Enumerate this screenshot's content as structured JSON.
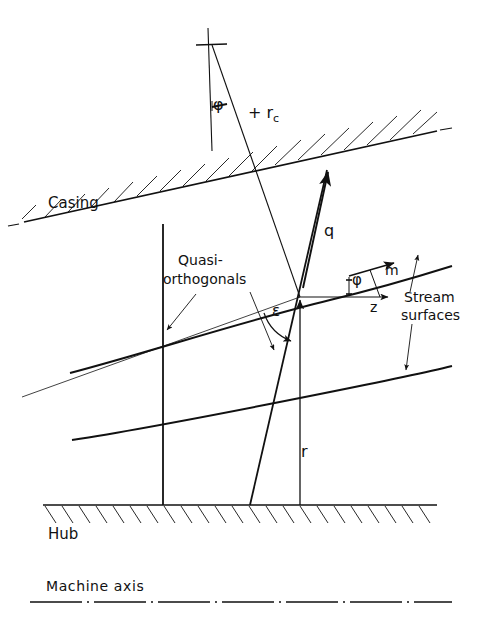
{
  "figure": {
    "type": "technical-line-diagram",
    "background_color": "#ffffff",
    "line_color": "#111111"
  },
  "labels": {
    "casing": "Casing",
    "hub": "Hub",
    "machine_axis": "Machine axis",
    "quasi_orthogonals_line1": "Quasi-",
    "quasi_orthogonals_line2": "orthogonals",
    "stream_surfaces_line1": "Stream",
    "stream_surfaces_line2": "surfaces",
    "radius_of_curvature": "+ r",
    "radius_of_curvature_sub": "c",
    "velocity_q": "q",
    "meridional_m": "m",
    "axial_z": "z",
    "radius_r": "r",
    "angle_phi_top": "φ",
    "angle_phi_mid": "φ",
    "angle_epsilon": "ε"
  },
  "geometry": {
    "casing_line": {
      "x1": 24,
      "y1": 222,
      "x2": 437,
      "y2": 131,
      "hatched_side": "above"
    },
    "hub_line": {
      "x1": 43,
      "y1": 505,
      "x2": 437,
      "y2": 505,
      "hatched_side": "below"
    },
    "machine_axis_line": {
      "x1": 30,
      "y1": 602,
      "x2": 450,
      "y2": 602,
      "style": "dash-dot"
    },
    "stream_surface_upper": {
      "x_start": 70,
      "y_start": 373,
      "x_end": 450,
      "y_end": 265
    },
    "stream_surface_lower": {
      "x_start": 72,
      "y_start": 440,
      "x_end": 450,
      "y_end": 368
    },
    "quasi_orthogonal_left": {
      "x1": 163,
      "y1": 224,
      "x2": 163,
      "y2": 505
    },
    "quasi_orthogonal_right": {
      "x1": 327,
      "y1": 170,
      "x2": 250,
      "y2": 505
    },
    "radius_line_rc": {
      "x1": 212,
      "y1": 45,
      "x2": 300,
      "y2": 297
    },
    "vertical_reference_top": {
      "x1": 207,
      "y1": 28,
      "x2": 212,
      "y2": 151
    },
    "velocity_vector_q": {
      "x1": 303,
      "y1": 283,
      "x2": 327,
      "y2": 170
    },
    "radius_vector_r": {
      "x1": 300,
      "y1": 505,
      "x2": 300,
      "y2": 297
    },
    "intersection_point": {
      "x": 297,
      "y": 297
    }
  },
  "vectors": {
    "q": {
      "name": "absolute-meridional-velocity",
      "direction": "up-right along quasi-orthogonal"
    },
    "m": {
      "name": "meridional-direction",
      "direction": "up-right along stream surface"
    },
    "z": {
      "name": "axial-direction",
      "direction": "right, parallel to machine axis"
    },
    "r": {
      "name": "radial-direction",
      "direction": "up, normal to machine axis"
    }
  },
  "angles": {
    "phi": {
      "symbol": "φ",
      "between": "meridional direction m and axial direction z"
    },
    "epsilon": {
      "symbol": "ε",
      "between": "quasi-orthogonal and stream surface"
    }
  },
  "caption": ""
}
